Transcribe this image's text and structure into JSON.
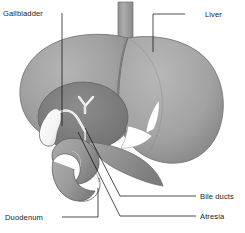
{
  "figure": {
    "width": 245,
    "height": 233,
    "background_color": "#ffffff",
    "style": "grayscale shaded medical line drawing"
  },
  "labels": {
    "gallbladder": "Gallbladder",
    "liver": "Liver",
    "bile_ducts": "Bile ducts",
    "atresia": "Atresia",
    "duodenum": "Duodenum"
  },
  "structures": {
    "liver": {
      "name": "Liver",
      "fill_color": "#9e9e9e",
      "outline_color": "#6b6b6b",
      "description": "large shaded organ occupying upper two-thirds of image, right lobe rounded, left lobe tapering"
    },
    "vena_cava": {
      "name": "Vena cava",
      "fill_color": "#a6a6a6",
      "description": "vertical tube emerging from top of liver"
    },
    "porta_hepatis": {
      "name": "Porta hepatis",
      "fill_color": "#7c7c7c",
      "description": "darker circular recess on liver undersurface containing gallbladder and ducts"
    },
    "gallbladder": {
      "name": "Gallbladder",
      "fill_color": "#fbfbfb",
      "outline_color": "#5f5f5f",
      "description": "white pear shaped sac in porta hepatis"
    },
    "cystic_duct": {
      "name": "Cystic duct",
      "fill_color": "#fbfbfb",
      "description": "white curving duct from gallbladder neck"
    },
    "hepatic_ducts": {
      "name": "Hepatic ducts",
      "fill_color": "#f7f7f7",
      "description": "white Y shaped duct branching above the porta hepatis"
    },
    "liver_edge_highlight": {
      "name": "Liver inferior highlight",
      "fill_color": "#ffffff",
      "description": "white crescent highlight on lower right liver margin"
    },
    "duodenum": {
      "name": "Duodenum",
      "fill_color": "#9c9c9c",
      "outline_color": "#5f5f5f",
      "description": "C shaped loop of bowel below the liver"
    },
    "pancreas": {
      "name": "Pancreas",
      "fill_color": "#949494",
      "description": "tapering body passing behind the duodenum"
    }
  },
  "leader_lines": {
    "stroke_color": "#111111",
    "count": 5
  },
  "colors": {
    "label_text": "#1a1a1a",
    "page_background": "#ffffff",
    "organ_mid": "#9e9e9e",
    "organ_dark": "#7c7c7c",
    "organ_light": "#c2c2c2",
    "duct_white": "#fbfbfb"
  }
}
